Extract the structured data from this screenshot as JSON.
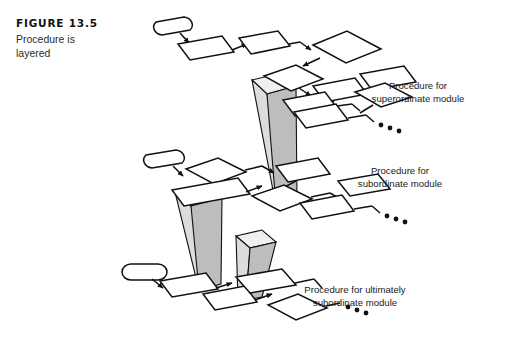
{
  "figure": {
    "number_label": "FIGURE 13.5",
    "caption_line1": "Procedure is",
    "caption_line2": "layered"
  },
  "labels": {
    "superordinate": {
      "line1": "Procedure for",
      "line2": "superordinate module"
    },
    "subordinate": {
      "line1": "Procedure for",
      "line2": "subordinate module"
    },
    "ultimately_subordinate": {
      "line1": "Procedure for ultimately",
      "line2": "subordinate module"
    }
  },
  "colors": {
    "background": "#ffffff",
    "stroke": "#111111",
    "pillar_light_face": "#dcdcdc",
    "pillar_dark_face": "#bdbdbd",
    "pillar_top_face": "#efefef",
    "caption_text": "#2b2b2b",
    "label_text": "#1b1b1b"
  },
  "diagram": {
    "type": "layered-flowchart-isometric",
    "layer_count": 3,
    "pillar_count": 3,
    "layers": [
      {
        "name": "superordinate-layer",
        "nodes": [
          {
            "shape": "terminator",
            "order": 1
          },
          {
            "shape": "process",
            "order": 2
          },
          {
            "shape": "process",
            "order": 3
          },
          {
            "shape": "decision",
            "order": 4
          },
          {
            "shape": "decision",
            "order": 5
          },
          {
            "shape": "process",
            "order": 6
          },
          {
            "shape": "process",
            "order": 7
          },
          {
            "shape": "process",
            "order": 8
          },
          {
            "shape": "decision",
            "order": 9
          },
          {
            "shape": "process",
            "order": 10
          }
        ],
        "trailing_ellipsis_dots": 3
      },
      {
        "name": "subordinate-layer",
        "nodes": [
          {
            "shape": "terminator",
            "order": 1
          },
          {
            "shape": "decision",
            "order": 2
          },
          {
            "shape": "process",
            "order": 3
          },
          {
            "shape": "process",
            "order": 4
          },
          {
            "shape": "decision",
            "order": 5
          },
          {
            "shape": "decision",
            "order": 6
          },
          {
            "shape": "process",
            "order": 7
          },
          {
            "shape": "process",
            "order": 8
          },
          {
            "shape": "process",
            "order": 9
          }
        ],
        "trailing_ellipsis_dots": 3
      },
      {
        "name": "ultimately-subordinate-layer",
        "nodes": [
          {
            "shape": "terminator",
            "order": 1
          },
          {
            "shape": "process",
            "order": 2
          },
          {
            "shape": "process",
            "order": 3
          },
          {
            "shape": "process",
            "order": 4
          },
          {
            "shape": "decision",
            "order": 5
          },
          {
            "shape": "decision",
            "order": 6
          }
        ],
        "trailing_ellipsis_dots": 3
      }
    ],
    "pillars": [
      {
        "name": "pillar-superordinate-to-subordinate"
      },
      {
        "name": "pillar-subordinate-to-ultimately-subordinate"
      },
      {
        "name": "pillar-ultimately-subordinate-base"
      }
    ]
  }
}
